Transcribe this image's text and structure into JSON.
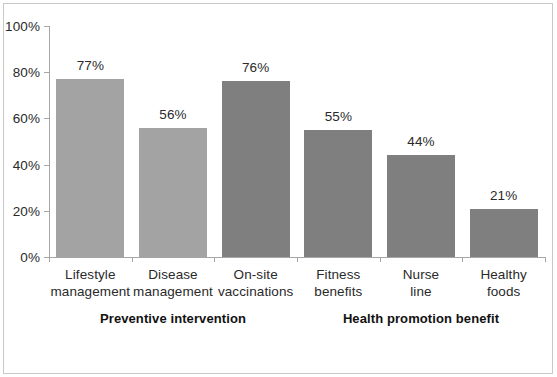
{
  "chart_data": {
    "type": "bar",
    "title": "",
    "subtitle": "",
    "xlabel": "",
    "ylabel": "",
    "ylim": [
      0,
      100
    ],
    "ytick_labels": [
      "0%",
      "20%",
      "40%",
      "60%",
      "80%",
      "100%"
    ],
    "ytick_values": [
      0,
      20,
      40,
      60,
      80,
      100
    ],
    "grid": false,
    "legend": "none",
    "categories": [
      "Lifestyle management",
      "Disease management",
      "On-site vaccinations",
      "Fitness benefits",
      "Nurse line",
      "Healthy foods"
    ],
    "category_lines": [
      [
        "Lifestyle",
        "management"
      ],
      [
        "Disease",
        "management"
      ],
      [
        "On-site",
        "vaccinations"
      ],
      [
        "Fitness",
        "benefits"
      ],
      [
        "Nurse",
        "line"
      ],
      [
        "Healthy",
        "foods"
      ]
    ],
    "values": [
      77,
      56,
      76,
      55,
      44,
      21
    ],
    "value_labels": [
      "77%",
      "56%",
      "76%",
      "55%",
      "44%",
      "21%"
    ],
    "bar_colors": [
      "#a3a3a3",
      "#a3a3a3",
      "#7f7f7f",
      "#7f7f7f",
      "#7f7f7f",
      "#7f7f7f"
    ],
    "groups": [
      {
        "label": "Preventive intervention",
        "start": 0,
        "end": 2
      },
      {
        "label": "Health promotion benefit",
        "start": 3,
        "end": 5
      }
    ],
    "axis_color": "#a6a6a6",
    "border_color": "#c9c9c9",
    "background_color": "#ffffff",
    "text_color": "#2a2a2a"
  }
}
